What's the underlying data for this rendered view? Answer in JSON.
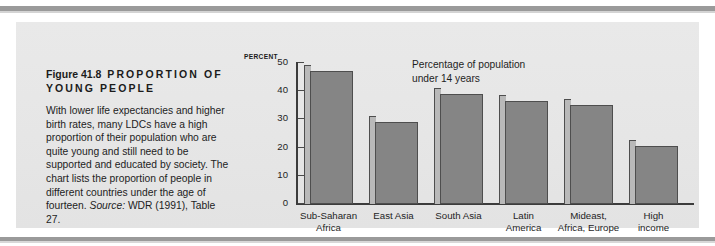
{
  "page": {
    "decor": {
      "top_rule_color": "#9a9a9a",
      "bottom_rule_color": "#9a9a9a",
      "panel_bg": "#e7e7e7"
    }
  },
  "caption": {
    "figure_number": "Figure 41.8",
    "figure_title": "PROPORTION OF YOUNG PEOPLE",
    "body": "With lower life expectancies and higher birth rates, many LDCs have a high proportion of their population who are quite young and still need to be supported and educated by society. The chart lists the proportion of people in different countries under the age of fourteen. ",
    "source_label": "Source:",
    "source_text": " WDR (1991), Table 27."
  },
  "chart_data": {
    "type": "bar",
    "annotation": "Percentage of population under 14 years",
    "annotation_lines": [
      "Percentage of population",
      "under 14 years"
    ],
    "axis_unit_label": "PERCENT",
    "xlabel": "",
    "ylabel": "PERCENT",
    "ylim": [
      0,
      50
    ],
    "yticks": [
      0,
      10,
      20,
      30,
      40,
      50
    ],
    "ytick_labels": [
      "0",
      "10",
      "20",
      "30",
      "40",
      "50"
    ],
    "grid": false,
    "legend": "none",
    "categories": [
      "Sub-Saharan Africa",
      "East Asia",
      "South Asia",
      "Latin America",
      "Mideast, Africa, Europe",
      "High income"
    ],
    "category_lines": [
      [
        "Sub-Saharan",
        "Africa"
      ],
      [
        "East Asia",
        ""
      ],
      [
        "South Asia",
        ""
      ],
      [
        "Latin",
        "America"
      ],
      [
        "Mideast,",
        "Africa, Europe"
      ],
      [
        "High",
        "income"
      ]
    ],
    "values": [
      47,
      29,
      39,
      36.5,
      35,
      20.5
    ],
    "bar_face_color": "#858585",
    "bar_side_color": "#b9b9b9",
    "bar_edge_color": "#4e4e4e"
  }
}
